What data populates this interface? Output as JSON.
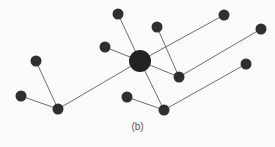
{
  "diagram": {
    "type": "star-network-graph",
    "caption": "(b)",
    "colors": {
      "node": "#2f2f2f",
      "hub": "#222222",
      "edge": "#6e6e6e",
      "background": "#fbfbfa"
    },
    "nodes": [
      {
        "id": "hub",
        "role": "hub"
      },
      {
        "id": "n-top",
        "role": "leaf"
      },
      {
        "id": "n-left-mid",
        "role": "leaf"
      },
      {
        "id": "n-upper-mid",
        "role": "leaf"
      },
      {
        "id": "n-top-right",
        "role": "leaf"
      },
      {
        "id": "n-far-right",
        "role": "leaf"
      },
      {
        "id": "n-right-lower",
        "role": "leaf"
      },
      {
        "id": "n-right-mid",
        "role": "relay"
      },
      {
        "id": "n-bottom",
        "role": "relay"
      },
      {
        "id": "n-bottom-left",
        "role": "leaf"
      },
      {
        "id": "n-left-upper",
        "role": "leaf"
      },
      {
        "id": "n-left-lower",
        "role": "leaf"
      },
      {
        "id": "n-lower-left-relay",
        "role": "relay"
      }
    ],
    "edges": [
      {
        "from": "hub",
        "to": "n-top"
      },
      {
        "from": "hub",
        "to": "n-left-mid"
      },
      {
        "from": "hub",
        "to": "n-lower-left-relay"
      },
      {
        "from": "hub",
        "to": "n-right-mid"
      },
      {
        "from": "hub",
        "to": "n-bottom"
      },
      {
        "from": "hub",
        "to": "n-top-right"
      },
      {
        "from": "n-upper-mid",
        "to": "n-right-mid"
      },
      {
        "from": "n-right-mid",
        "to": "n-far-right"
      },
      {
        "from": "n-bottom",
        "to": "n-right-lower"
      },
      {
        "from": "n-bottom",
        "to": "n-bottom-left"
      },
      {
        "from": "n-lower-left-relay",
        "to": "n-left-upper"
      },
      {
        "from": "n-lower-left-relay",
        "to": "n-left-lower"
      }
    ]
  }
}
